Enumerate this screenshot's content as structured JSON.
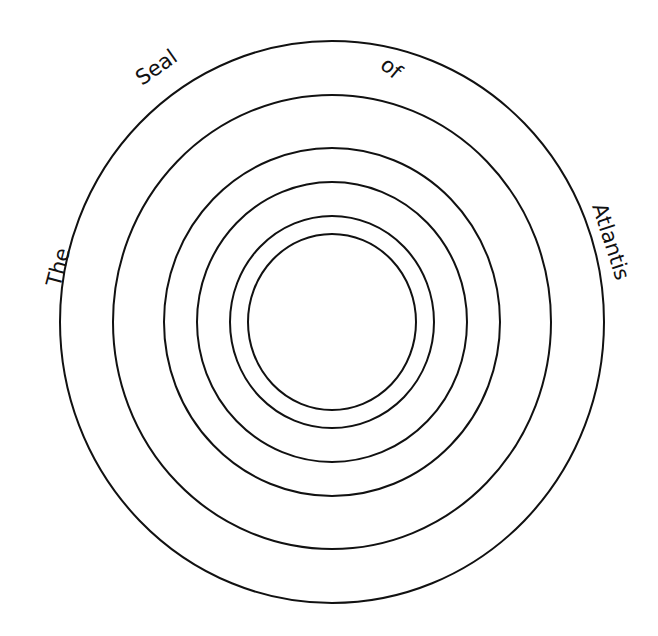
{
  "title_words": {
    "w1": "The",
    "w2": "Seal",
    "w3": "of",
    "w4": "Atlantis"
  },
  "diagram": {
    "type": "concentric-circles",
    "ring_count": 6,
    "stroke_color": "#111111",
    "background": "#ffffff"
  }
}
